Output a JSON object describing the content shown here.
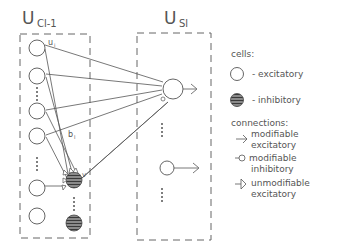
{
  "diagram": {
    "layer_left": {
      "label": "U",
      "subscript": "Cl-1"
    },
    "layer_right": {
      "label": "U",
      "subscript": "Sl"
    },
    "cell_labels": {
      "u_i": "u",
      "u_i_sub": "i",
      "b_l": "b",
      "b_l_sub": "l",
      "v": "v"
    }
  },
  "legend": {
    "cells_title": "cells:",
    "excitatory": "- excitatory",
    "inhibitory": "- inhibitory",
    "connections_title": "connections:",
    "mod_exc_1": "modifiable",
    "mod_exc_2": "excitatory",
    "mod_inh_1": "modifiable",
    "mod_inh_2": "inhibitory",
    "unmod_exc_1": "unmodifiable",
    "unmod_exc_2": "excitatory"
  },
  "colors": {
    "stroke": "#555555",
    "inhibitory_fill": "#777777"
  }
}
